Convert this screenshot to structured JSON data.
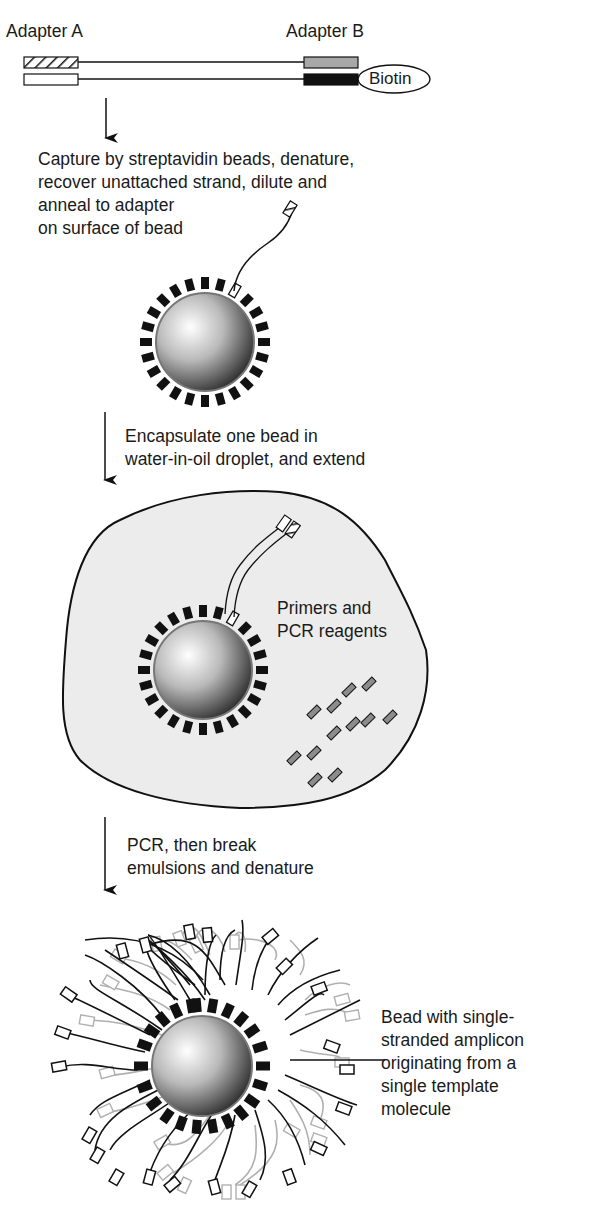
{
  "diagram": {
    "type": "emulsion-PCR workflow",
    "colors": {
      "stroke": "#111111",
      "droplet_fill": "#ececec",
      "adapter_b_top": "#a8a8a8",
      "adapter_b_bottom": "#111111",
      "amplicon_light": "#b0b0b0",
      "reagent_fill": "#8c8c8c"
    },
    "step0": {
      "adapter_a_label": "Adapter A",
      "adapter_b_label": "Adapter B",
      "biotin_label": "Biotin"
    },
    "step1": {
      "lines": [
        "Capture by streptavidin beads, denature,",
        "recover unattached strand, dilute and",
        "anneal to adapter",
        "on surface of bead"
      ]
    },
    "step2": {
      "lines": [
        "Encapsulate one bead in",
        "water-in-oil droplet, and extend"
      ],
      "droplet_label_lines": [
        "Primers and",
        "PCR reagents"
      ]
    },
    "step3": {
      "lines": [
        "PCR, then break",
        "emulsions and denature"
      ]
    },
    "result": {
      "lines": [
        "Bead with single-",
        "stranded amplicon",
        "originating from a",
        "single template",
        "molecule"
      ]
    }
  }
}
